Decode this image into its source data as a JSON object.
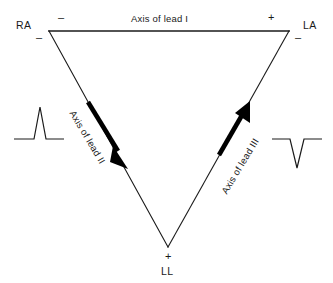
{
  "figure": {
    "stroke_color": "#1a1a1a",
    "background_color": "#ffffff",
    "vertices": [
      {
        "id": "RA",
        "label": "RA",
        "x": 49,
        "y": 31,
        "name": "right-arm"
      },
      {
        "id": "LA",
        "label": "LA",
        "x": 289,
        "y": 31,
        "name": "left-arm"
      },
      {
        "id": "LL",
        "label": "LL",
        "x": 168,
        "y": 247,
        "name": "left-leg"
      }
    ],
    "vertex_labels": {
      "ra": "RA",
      "la": "LA",
      "ll": "LL"
    },
    "axis_labels": {
      "lead_1": "Axis of lead I",
      "lead_2": "Axis of lead II",
      "lead_3": "Axis of lead III"
    },
    "polarity_signs": {
      "lead1_negative": "–",
      "lead1_positive": "+",
      "lead2_negative": "–",
      "lead2_positive": "+",
      "lead3_negative": "–",
      "lead3_positive": "+"
    },
    "waveforms": {
      "left": {
        "name": "upright-qrs-complex",
        "polarity": "positive"
      },
      "right": {
        "name": "inverted-qrs-complex",
        "polarity": "negative"
      }
    },
    "arrows": {
      "lead_2": {
        "direction": "down-right",
        "from_vertex": "RA",
        "to_vertex": "LL"
      },
      "lead_3": {
        "direction": "up-right",
        "from_vertex": "LL",
        "to_vertex": "LA"
      }
    }
  }
}
